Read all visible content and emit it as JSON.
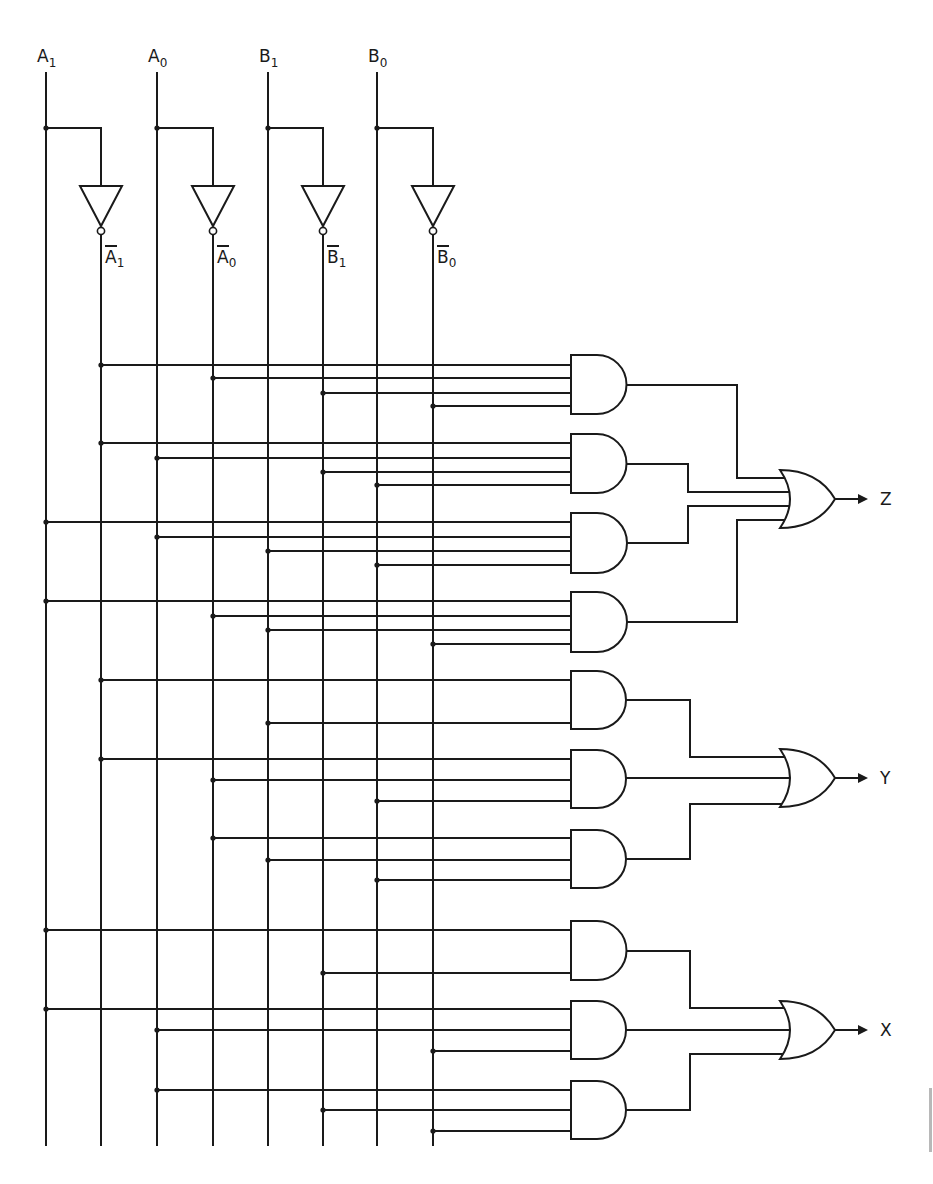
{
  "diagram": {
    "colors": {
      "ink": "#1a1a1a",
      "background": "#ffffff",
      "edge_mark": "#b8b8b8"
    },
    "inputs": [
      {
        "id": "A1",
        "letter": "A",
        "sub": "1",
        "x": 46
      },
      {
        "id": "A0",
        "letter": "A",
        "sub": "0",
        "x": 157
      },
      {
        "id": "B1",
        "letter": "B",
        "sub": "1",
        "x": 268
      },
      {
        "id": "B0",
        "letter": "B",
        "sub": "0",
        "x": 377
      }
    ],
    "inverted": [
      {
        "id": "nA1",
        "letter": "A",
        "sub": "1",
        "x": 101
      },
      {
        "id": "nA0",
        "letter": "A",
        "sub": "0",
        "x": 213
      },
      {
        "id": "nB1",
        "letter": "B",
        "sub": "1",
        "x": 323
      },
      {
        "id": "nB0",
        "letter": "B",
        "sub": "0",
        "x": 433
      }
    ],
    "and_gates": [
      {
        "n": 1,
        "top": 355,
        "bottom": 414,
        "out_y": 385,
        "inputs": [
          [
            "nA1",
            365
          ],
          [
            "nA0",
            378
          ],
          [
            "nB1",
            393
          ],
          [
            "nB0",
            406
          ]
        ],
        "feeds": "Z"
      },
      {
        "n": 2,
        "top": 434,
        "bottom": 493,
        "out_y": 464,
        "inputs": [
          [
            "nA1",
            443
          ],
          [
            "A0",
            458
          ],
          [
            "nB1",
            472
          ],
          [
            "B0",
            485
          ]
        ],
        "feeds": "Z"
      },
      {
        "n": 3,
        "top": 513,
        "bottom": 573,
        "out_y": 543,
        "inputs": [
          [
            "A1",
            522
          ],
          [
            "A0",
            537
          ],
          [
            "B1",
            551
          ],
          [
            "B0",
            565
          ]
        ],
        "feeds": "Z"
      },
      {
        "n": 4,
        "top": 592,
        "bottom": 652,
        "out_y": 622,
        "inputs": [
          [
            "A1",
            601
          ],
          [
            "nA0",
            616
          ],
          [
            "B1",
            630
          ],
          [
            "nB0",
            644
          ]
        ],
        "feeds": "Z"
      },
      {
        "n": 5,
        "top": 671,
        "bottom": 729,
        "out_y": 700,
        "inputs": [
          [
            "nA1",
            680
          ],
          [
            "B1",
            723
          ]
        ],
        "feeds": "Y"
      },
      {
        "n": 6,
        "top": 750,
        "bottom": 808,
        "out_y": 778,
        "inputs": [
          [
            "nA1",
            759
          ],
          [
            "nA0",
            780
          ],
          [
            "B0",
            801
          ]
        ],
        "feeds": "Y"
      },
      {
        "n": 7,
        "top": 830,
        "bottom": 888,
        "out_y": 859,
        "inputs": [
          [
            "nA0",
            838
          ],
          [
            "B1",
            860
          ],
          [
            "B0",
            880
          ]
        ],
        "feeds": "Y"
      },
      {
        "n": 8,
        "top": 921,
        "bottom": 980,
        "out_y": 951,
        "inputs": [
          [
            "A1",
            930
          ],
          [
            "nB1",
            973
          ]
        ],
        "feeds": "X"
      },
      {
        "n": 9,
        "top": 1001,
        "bottom": 1059,
        "out_y": 1030,
        "inputs": [
          [
            "A1",
            1009
          ],
          [
            "A0",
            1030
          ],
          [
            "nB0",
            1051
          ]
        ],
        "feeds": "X"
      },
      {
        "n": 10,
        "top": 1081,
        "bottom": 1139,
        "out_y": 1110,
        "inputs": [
          [
            "A0",
            1090
          ],
          [
            "nB1",
            1110
          ],
          [
            "nB0",
            1131
          ]
        ],
        "feeds": "X"
      }
    ],
    "or_gates": [
      {
        "output": "Z",
        "label": "Z",
        "center_y": 499,
        "input_ys": [
          478,
          492,
          506,
          520
        ],
        "routes": [
          [
            1,
            737
          ],
          [
            2,
            688
          ],
          [
            3,
            688
          ],
          [
            4,
            737
          ]
        ]
      },
      {
        "output": "Y",
        "label": "Y",
        "center_y": 778,
        "input_ys": [
          757,
          778,
          804
        ],
        "routes": [
          [
            5,
            690
          ],
          [
            6,
            null
          ],
          [
            7,
            690
          ]
        ]
      },
      {
        "output": "X",
        "label": "X",
        "center_y": 1030,
        "input_ys": [
          1008,
          1030,
          1054
        ],
        "routes": [
          [
            8,
            690
          ],
          [
            9,
            null
          ],
          [
            10,
            690
          ]
        ]
      }
    ],
    "outputs": [
      "Z",
      "Y",
      "X"
    ]
  }
}
